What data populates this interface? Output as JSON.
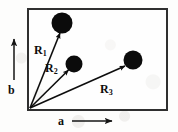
{
  "figure": {
    "cropped_heading_text": "Unit cell",
    "background_color": "#fdfdfc",
    "ink_color": "#0d0d0d",
    "cell_border_color": "#2f2f2f"
  },
  "cell": {
    "name": "unit-cell-box",
    "x": 27,
    "y": 8,
    "width": 141,
    "height": 103,
    "border_width": 2
  },
  "axes": {
    "horizontal": {
      "label": "a",
      "arrow_direction": "right",
      "label_x": 58,
      "label_y": 117,
      "arrow_x1": 72,
      "arrow_x2": 113,
      "arrow_y": 121
    },
    "vertical": {
      "label": "b",
      "arrow_direction": "up",
      "label_x": 8,
      "label_y": 84,
      "arrow_x": 14,
      "arrow_y1": 80,
      "arrow_y2": 38
    }
  },
  "origin": {
    "x": 30,
    "y": 108
  },
  "vectors": [
    {
      "name": "vector-R1",
      "label": "R",
      "subscript": "1",
      "label_x": 34,
      "label_y": 44,
      "tip_x": 60,
      "tip_y": 33,
      "atom_cx": 62,
      "atom_cy": 23,
      "atom_r": 10.5
    },
    {
      "name": "vector-R2",
      "label": "R",
      "subscript": "2",
      "label_x": 45,
      "label_y": 62,
      "tip_x": 68,
      "tip_y": 70,
      "atom_cx": 74,
      "atom_cy": 64,
      "atom_r": 8.5
    },
    {
      "name": "vector-R3",
      "label": "R",
      "subscript": "3",
      "label_x": 100,
      "label_y": 83,
      "tip_x": 125,
      "tip_y": 66,
      "atom_cx": 133,
      "atom_cy": 60,
      "atom_r": 9.5
    }
  ]
}
